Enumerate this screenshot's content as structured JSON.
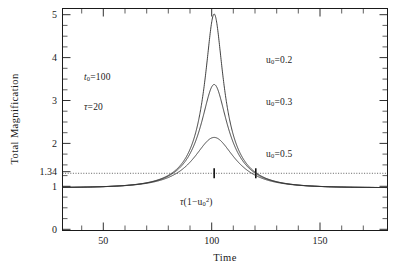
{
  "chart_data": {
    "type": "line",
    "title": "",
    "xlabel": "Time",
    "ylabel": "Total Magnification",
    "xlim": [
      30,
      180
    ],
    "ylim": [
      0,
      5.2
    ],
    "xticks": [
      50,
      100,
      150
    ],
    "xtick_labels": [
      "50",
      "100",
      "150"
    ],
    "yticks": [
      0,
      1,
      1.34,
      2,
      3,
      4,
      5
    ],
    "ytick_labels": [
      "0",
      "1",
      "1.34",
      "2",
      "3",
      "4",
      "5"
    ],
    "grid": false,
    "legend_position": "inside-right",
    "reference_line": {
      "orientation": "horizontal",
      "value": 1.34,
      "style": "dotted",
      "label": "1.34"
    },
    "parameters": {
      "t0_label": "t",
      "t0_sub": "0",
      "t0_value": "=100",
      "tau_label": "τ",
      "tau_value": "=20"
    },
    "series": [
      {
        "name": "u0=0.2",
        "label_u": "u",
        "label_sub": "0",
        "label_value": "=0.2",
        "u0": 0.2,
        "t0": 100,
        "tau": 20,
        "peak_time": 100,
        "peak_value": 5.07
      },
      {
        "name": "u0=0.3",
        "label_u": "u",
        "label_sub": "0",
        "label_value": "=0.3",
        "u0": 0.3,
        "t0": 100,
        "tau": 20,
        "peak_time": 100,
        "peak_value": 3.42
      },
      {
        "name": "u0=0.5",
        "label_u": "u",
        "label_sub": "0",
        "label_value": "=0.5",
        "u0": 0.5,
        "t0": 100,
        "tau": 20,
        "peak_time": 100,
        "peak_value": 2.18
      }
    ],
    "annotations": [
      {
        "name": "duration-annotation",
        "tau": "τ",
        "open": "(1−u",
        "sub": "0",
        "sup": "2",
        "close": ")",
        "markers_at": [
          100,
          119.2
        ],
        "marker_level": 1.34
      }
    ]
  },
  "labels": {
    "t0": "t",
    "t0_sub": "0",
    "t0_eq": "=100",
    "tau": "τ",
    "tau_eq": "=20",
    "u": "u",
    "u_sub": "0",
    "u1_eq": "=0.2",
    "u2_eq": "=0.3",
    "u3_eq": "=0.5",
    "dur_tau": "τ",
    "dur_open": "(1−u",
    "dur_sub": "0",
    "dur_sup": "2",
    "dur_close": ")"
  }
}
